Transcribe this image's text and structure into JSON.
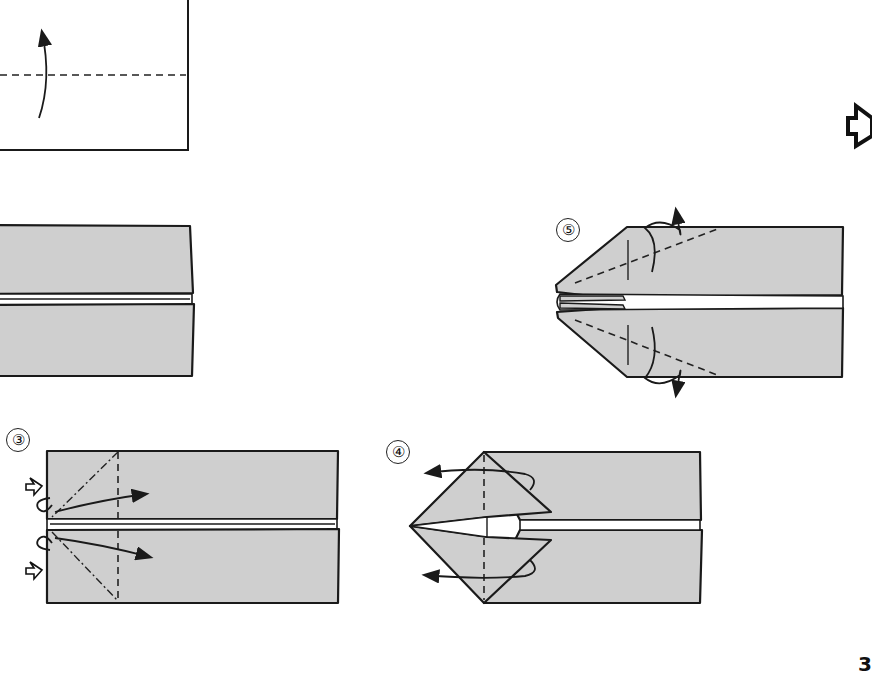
{
  "page": {
    "number": "3",
    "background": "#ffffff",
    "paper_color": "#cfcfcf",
    "line_color": "#1a1a1a"
  },
  "steps": [
    {
      "id": 1,
      "label": "",
      "description": "White paper rectangle with horizontal valley fold line and curved arrow pointing up (fold in half)"
    },
    {
      "id": 2,
      "label": "",
      "description": "Paper folded into two shaded strips with narrow white gap between"
    },
    {
      "id": 3,
      "label": "③",
      "description": "Shaded strips with dashed/dot-dash diagonal crease lines at left end, push-in arrows and curved arrows"
    },
    {
      "id": 4,
      "label": "④",
      "description": "Left end folded into a pointed kite shape with flaps; curved arrows pointing left"
    },
    {
      "id": 5,
      "label": "⑤",
      "description": "Pointed nose shape with dashed diagonal fold lines and curved turn-over arrows top and bottom"
    }
  ],
  "symbols": {
    "next_arrow": "hollow-right-arrow"
  }
}
